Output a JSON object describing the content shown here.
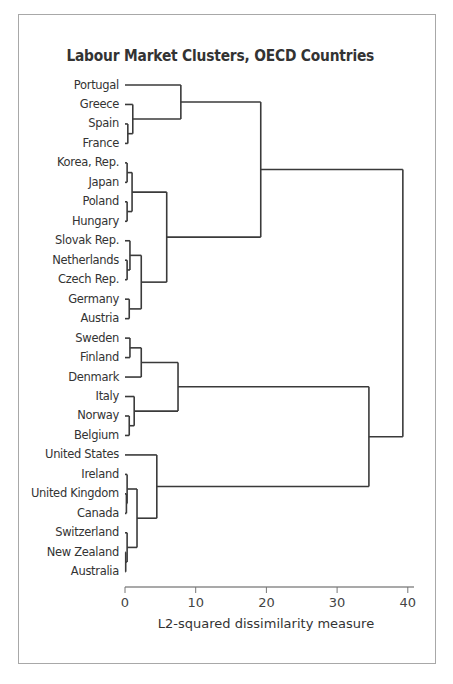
{
  "chart_data": {
    "type": "dendrogram",
    "title": "Labour Market Clusters, OECD Countries",
    "xlabel": "L2-squared dissimilarity measure",
    "ylabel": "",
    "xlim": [
      0,
      41
    ],
    "xticks": [
      0,
      10,
      20,
      30,
      40
    ],
    "grid": false,
    "legend": null,
    "orientation": "horizontal",
    "leaves": [
      "Portugal",
      "Greece",
      "Spain",
      "France",
      "Korea, Rep.",
      "Japan",
      "Poland",
      "Hungary",
      "Slovak Rep.",
      "Netherlands",
      "Czech Rep.",
      "Germany",
      "Austria",
      "Sweden",
      "Finland",
      "Denmark",
      "Italy",
      "Norway",
      "Belgium",
      "United States",
      "Ireland",
      "United Kingdom",
      "Canada",
      "Switzerland",
      "New Zealand",
      "Australia"
    ],
    "merges": [
      {
        "id": "c_SF",
        "children": [
          "Spain",
          "France"
        ],
        "height": 0.4
      },
      {
        "id": "c_GSF",
        "children": [
          "Greece",
          "c_SF"
        ],
        "height": 1.1
      },
      {
        "id": "c_PGSF",
        "children": [
          "Portugal",
          "c_GSF"
        ],
        "height": 7.9
      },
      {
        "id": "c_KJ",
        "children": [
          "Korea, Rep.",
          "Japan"
        ],
        "height": 0.3
      },
      {
        "id": "c_PH",
        "children": [
          "Poland",
          "Hungary"
        ],
        "height": 0.3
      },
      {
        "id": "c_KJPH",
        "children": [
          "c_KJ",
          "c_PH"
        ],
        "height": 1.0
      },
      {
        "id": "c_NC",
        "children": [
          "Netherlands",
          "Czech Rep."
        ],
        "height": 0.3
      },
      {
        "id": "c_SNC",
        "children": [
          "Slovak Rep.",
          "c_NC"
        ],
        "height": 0.7
      },
      {
        "id": "c_GA",
        "children": [
          "Germany",
          "Austria"
        ],
        "height": 0.6
      },
      {
        "id": "c_SNCGA",
        "children": [
          "c_SNC",
          "c_GA"
        ],
        "height": 2.3
      },
      {
        "id": "c_EAST",
        "children": [
          "c_KJPH",
          "c_SNCGA"
        ],
        "height": 5.9
      },
      {
        "id": "c_TOP1",
        "children": [
          "c_PGSF",
          "c_EAST"
        ],
        "height": 19.2
      },
      {
        "id": "c_SwFi",
        "children": [
          "Sweden",
          "Finland"
        ],
        "height": 0.7
      },
      {
        "id": "c_SwFiDk",
        "children": [
          "c_SwFi",
          "Denmark"
        ],
        "height": 2.3
      },
      {
        "id": "c_NB",
        "children": [
          "Norway",
          "Belgium"
        ],
        "height": 0.6
      },
      {
        "id": "c_INB",
        "children": [
          "Italy",
          "c_NB"
        ],
        "height": 1.3
      },
      {
        "id": "c_NORD",
        "children": [
          "c_SwFiDk",
          "c_INB"
        ],
        "height": 7.5
      },
      {
        "id": "c_UKCa",
        "children": [
          "United Kingdom",
          "Canada"
        ],
        "height": 0.2
      },
      {
        "id": "c_IrUKCa",
        "children": [
          "Ireland",
          "c_UKCa"
        ],
        "height": 0.3
      },
      {
        "id": "c_NZAu",
        "children": [
          "New Zealand",
          "Australia"
        ],
        "height": 0.1
      },
      {
        "id": "c_ChNZAu",
        "children": [
          "Switzerland",
          "c_NZAu"
        ],
        "height": 0.3
      },
      {
        "id": "c_ANGLO5",
        "children": [
          "c_IrUKCa",
          "c_ChNZAu"
        ],
        "height": 1.7
      },
      {
        "id": "c_ANGLO",
        "children": [
          "United States",
          "c_ANGLO5"
        ],
        "height": 4.5
      },
      {
        "id": "c_TOP2",
        "children": [
          "c_NORD",
          "c_ANGLO"
        ],
        "height": 34.5
      },
      {
        "id": "c_ROOT",
        "children": [
          "c_TOP1",
          "c_TOP2"
        ],
        "height": 39.3
      }
    ]
  },
  "layout": {
    "axis_x0": 125,
    "px_per_unit": 7.07,
    "leaf_y0": 85,
    "leaf_step": 19.47,
    "axis_y": 587,
    "axis_end": 414,
    "line_color": "#3a3a3a"
  }
}
